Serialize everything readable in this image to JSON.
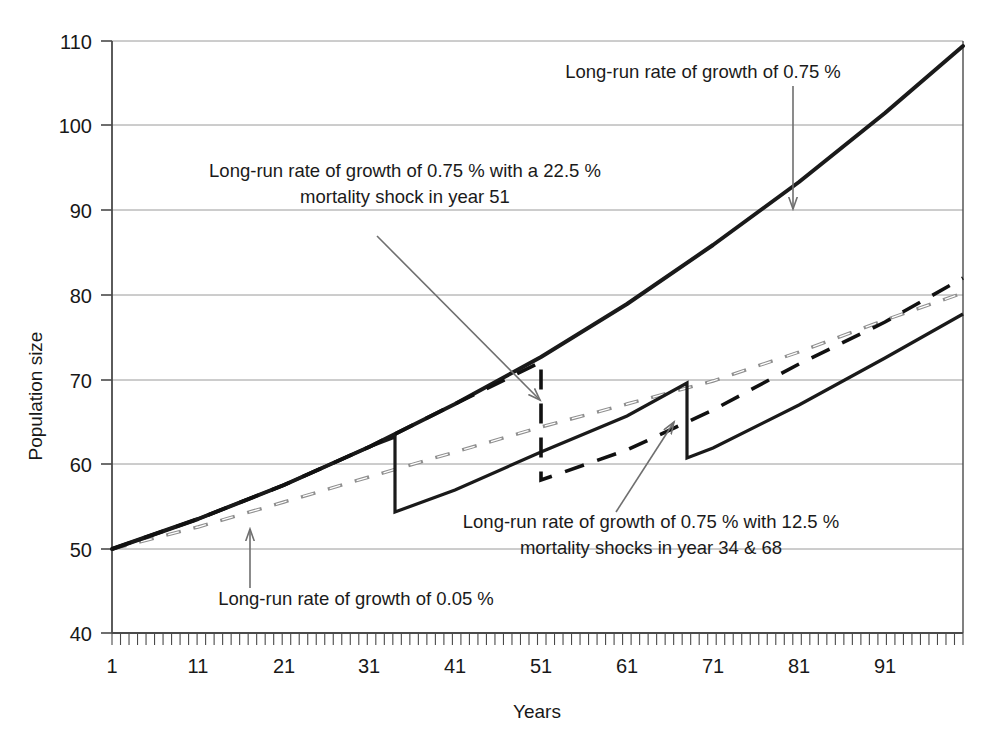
{
  "chart_data": {
    "type": "line",
    "title": "",
    "xlabel": "Years",
    "ylabel": "Population size",
    "xlim": [
      1,
      100
    ],
    "ylim": [
      40,
      110
    ],
    "grid": true,
    "legend_position": "none",
    "xticks": [
      "1",
      "11",
      "21",
      "31",
      "41",
      "51",
      "61",
      "71",
      "81",
      "91"
    ],
    "xtick_values": [
      1,
      11,
      21,
      31,
      41,
      51,
      61,
      71,
      81,
      91
    ],
    "yticks": [
      "40",
      "50",
      "60",
      "70",
      "80",
      "90",
      "100",
      "110"
    ],
    "ytick_values": [
      40,
      50,
      60,
      70,
      80,
      90,
      100,
      110
    ],
    "x": [
      1,
      10,
      20,
      30,
      34,
      40,
      50,
      51,
      60,
      68,
      70,
      80,
      90,
      100
    ],
    "series": [
      {
        "name": "Long-run rate of growth of 0.75 %",
        "style": "solid",
        "color": "#1a1a1a",
        "points": [
          [
            1,
            50.0
          ],
          [
            10,
            53.5
          ],
          [
            20,
            57.6
          ],
          [
            30,
            62.0
          ],
          [
            34,
            63.9
          ],
          [
            40,
            66.8
          ],
          [
            50,
            72.0
          ],
          [
            51,
            72.5
          ],
          [
            60,
            77.5
          ],
          [
            68,
            82.3
          ],
          [
            70,
            83.5
          ],
          [
            80,
            90.0
          ],
          [
            90,
            97.1
          ],
          [
            100,
            105.0
          ]
        ]
      },
      {
        "name": "Long-run rate of growth of 0.75 % with a 22.5 % mortality shock in year 51",
        "style": "dashed",
        "color": "#111111",
        "shock_year": 51,
        "shock_pct": 22.5,
        "points": [
          [
            1,
            50.0
          ],
          [
            10,
            53.5
          ],
          [
            20,
            57.6
          ],
          [
            30,
            62.0
          ],
          [
            34,
            63.9
          ],
          [
            40,
            66.8
          ],
          [
            50,
            71.4
          ],
          [
            51,
            71.5
          ],
          [
            51.01,
            57.5
          ],
          [
            60,
            61.5
          ],
          [
            68,
            66.0
          ],
          [
            70,
            67.2
          ],
          [
            80,
            72.5
          ],
          [
            90,
            77.0
          ],
          [
            100,
            81.3
          ]
        ]
      },
      {
        "name": "Long-run rate of growth of 0.75 % with 12.5 % mortality shocks in year 34 & 68",
        "style": "solid",
        "color": "#1a1a1a",
        "shock_years": [
          34,
          68
        ],
        "shock_pct": 12.5,
        "points": [
          [
            1,
            50.0
          ],
          [
            10,
            53.5
          ],
          [
            20,
            57.6
          ],
          [
            30,
            62.0
          ],
          [
            34,
            63.2
          ],
          [
            34.01,
            55.3
          ],
          [
            40,
            57.8
          ],
          [
            50,
            62.5
          ],
          [
            51,
            63.0
          ],
          [
            60,
            67.3
          ],
          [
            68,
            71.2
          ],
          [
            68.01,
            62.3
          ],
          [
            70,
            63.2
          ],
          [
            80,
            68.6
          ],
          [
            90,
            74.4
          ],
          [
            100,
            80.7
          ]
        ]
      },
      {
        "name": "Long-run rate of growth of 0.05 %",
        "style": "dashed-light",
        "color": "#8a8a8a",
        "points": [
          [
            1,
            50.0
          ],
          [
            10,
            52.6
          ],
          [
            20,
            55.6
          ],
          [
            30,
            58.5
          ],
          [
            34,
            59.7
          ],
          [
            40,
            61.4
          ],
          [
            50,
            64.4
          ],
          [
            51,
            64.7
          ],
          [
            60,
            67.3
          ],
          [
            68,
            69.6
          ],
          [
            70,
            70.2
          ],
          [
            80,
            73.3
          ],
          [
            90,
            76.8
          ],
          [
            100,
            81.5
          ]
        ]
      }
    ],
    "annotations": [
      {
        "id": "annot-long-run-075",
        "lines": [
          "Long-run rate of growth of 0.75 %"
        ],
        "target_series": "Long-run rate of growth of 0.75 %"
      },
      {
        "id": "annot-shock-51",
        "lines": [
          "Long-run rate of growth of 0.75 % with a 22.5 %",
          "mortality shock in year 51"
        ],
        "target_series": "Long-run rate of growth of 0.75 % with a 22.5 % mortality shock in year 51"
      },
      {
        "id": "annot-shock-34-68",
        "lines": [
          "Long-run rate of growth of 0.75 % with 12.5 %",
          "mortality shocks in year 34 & 68"
        ],
        "target_series": "Long-run rate of growth of 0.75 % with 12.5 % mortality shocks in year 34 & 68"
      },
      {
        "id": "annot-long-run-005",
        "lines": [
          "Long-run rate of growth of 0.05 %"
        ],
        "target_series": "Long-run rate of growth of 0.05 %"
      }
    ]
  },
  "axes": {
    "x_title": "Years",
    "y_title": "Population size",
    "y_labels": {
      "t110": "110",
      "t100": "100",
      "t90": "90",
      "t80": "80",
      "t70": "70",
      "t60": "60",
      "t50": "50",
      "t40": "40"
    },
    "x_labels": {
      "t1": "1",
      "t11": "11",
      "t21": "21",
      "t31": "31",
      "t41": "41",
      "t51": "51",
      "t61": "61",
      "t71": "71",
      "t81": "81",
      "t91": "91"
    }
  },
  "annotations": {
    "top_right": {
      "line1": "Long-run rate of growth of 0.75 %"
    },
    "shock51": {
      "line1": "Long-run rate of growth of 0.75 % with a 22.5 %",
      "line2": "mortality shock in year 51"
    },
    "shock3468": {
      "line1": "Long-run rate of growth of 0.75 % with 12.5 %",
      "line2": "mortality shocks in year 34 & 68"
    },
    "lowgrowth": {
      "line1": "Long-run rate of growth of 0.05 %"
    }
  },
  "colors": {
    "axis": "#4a4a4a",
    "grid": "#9a9a9a",
    "solid_line": "#1a1a1a",
    "dashed_line": "#111111",
    "light_dashed_line": "#8f8f8f",
    "annotation_leader": "#6f6f6f",
    "text": "#1a1a1a",
    "background": "#ffffff"
  }
}
